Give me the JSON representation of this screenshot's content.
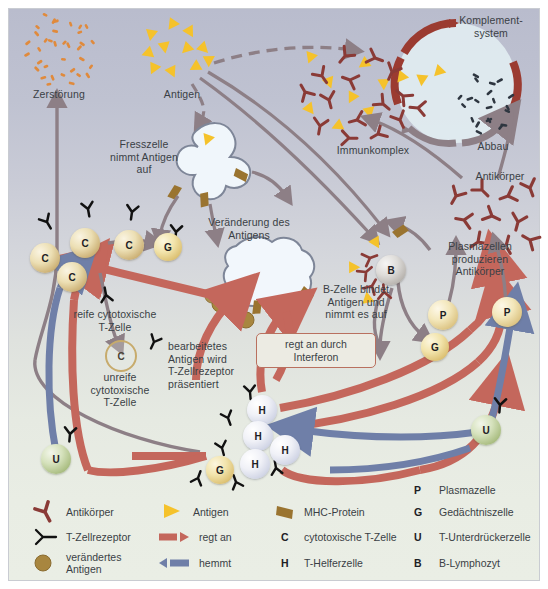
{
  "diagram": {
    "background_top": "#b9bccd",
    "background_bottom": "#eaeee5",
    "colors": {
      "antibody": "#8a3a36",
      "antigen": "#f5c22b",
      "mhc_protein": "#9a7430",
      "regt_an": "#c4675c",
      "hemmt": "#6f7fa8",
      "altered_antigen": "#a8863f",
      "debris_destruction": "#e08a3c",
      "debris_abbau": "#2e3640",
      "plain_arrow": "#8d7f86",
      "text": "#3a3f45"
    },
    "labels": {
      "zerstoerung": "Zerstörung",
      "antigen": "Antigen",
      "fresszelle": "Fresszelle\nnimmt Antigen\nauf",
      "komplementsystem": "Komplement-\nsystem",
      "immunkomplex": "Immunkomplex",
      "abbau": "Abbau",
      "antikoerper": "Antikörper",
      "veraenderung": "Veränderung des\nAntigens",
      "reife_t": "reife cytotoxische\nT-Zelle",
      "unreife_t": "unreife\ncytotoxische\nT-Zelle",
      "bearbeitetes": "bearbeitetes\nAntigen wird\nT-Zellrezeptor\npräsentiert",
      "bzelle": "B-Zelle bindet\nAntigen und\nnimmt es auf",
      "plasmazellen": "Plasmazellen\nproduzieren\nAntikörper",
      "interferon": "regt an durch\nInterferon"
    },
    "cells": {
      "c1": "C",
      "c2": "C",
      "c3": "C",
      "c4": "C",
      "c_immature": "C",
      "g1": "G",
      "g2": "G",
      "g3": "G",
      "h1": "H",
      "h2": "H",
      "h3": "H",
      "h4": "H",
      "p1": "P",
      "p2": "P",
      "u1": "U",
      "u2": "U",
      "b1": "B"
    }
  },
  "legend": {
    "col1": [
      {
        "key": "antibody-icon",
        "label": "Antikörper"
      },
      {
        "key": "tcell-receptor-icon",
        "label": "T-Zellrezeptor"
      },
      {
        "key": "altered-antigen-icon",
        "label": "verändertes\nAntigen"
      }
    ],
    "col2": [
      {
        "key": "antigen-icon",
        "label": "Antigen"
      },
      {
        "key": "stimulates-arrow-icon",
        "label": "regt an"
      },
      {
        "key": "inhibits-arrow-icon",
        "label": "hemmt"
      }
    ],
    "col3": [
      {
        "key": "mhc-protein-icon",
        "label": "MHC-Protein"
      },
      {
        "key": "C",
        "label": "cytotoxische T-Zelle"
      },
      {
        "key": "H",
        "label": "T-Helferzelle"
      }
    ],
    "col4": [
      {
        "key": "P",
        "label": "Plasmazelle"
      },
      {
        "key": "G",
        "label": "Gedächtniszelle"
      },
      {
        "key": "U",
        "label": "T-Unterdrückerzelle"
      },
      {
        "key": "B",
        "label": "B-Lymphozyt"
      }
    ]
  }
}
